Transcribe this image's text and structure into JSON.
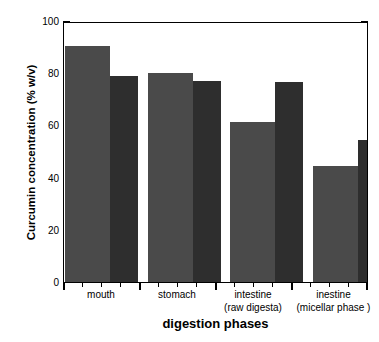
{
  "chart_data": {
    "type": "bar",
    "title": "",
    "xlabel": "digestion phases",
    "ylabel": "Curcumin concentration (% w/v)",
    "categories": [
      "mouth",
      "stomach",
      "intestine\n(raw digesta)",
      "inestine\n(micellar phase )"
    ],
    "category_lines": [
      [
        "mouth",
        ""
      ],
      [
        "stomach",
        ""
      ],
      [
        "intestine",
        "(raw digesta)"
      ],
      [
        "inestine",
        "(micellar phase )"
      ]
    ],
    "series": [
      {
        "name": "series-1",
        "color": "#4a4a4a",
        "values": [
          90.5,
          80.0,
          61.5,
          44.5
        ]
      },
      {
        "name": "series-2",
        "color": "#2e2e2e",
        "values": [
          79.0,
          77.0,
          76.5,
          54.5
        ]
      }
    ],
    "ylim": [
      0,
      100
    ],
    "yticks": [
      0,
      20,
      40,
      60,
      80,
      100
    ],
    "ytick_labels": [
      "0",
      "20",
      "40",
      "60",
      "80",
      "100"
    ],
    "y_minor_interval": 10,
    "grid": false,
    "legend": "none",
    "frame": true,
    "ticks_direction": "out",
    "ticks_all_sides": true
  },
  "colors": {
    "background": "#ffffff",
    "axis": "#000000",
    "text": "#000000",
    "bar_light": "#4a4a4a",
    "bar_dark": "#2e2e2e"
  }
}
